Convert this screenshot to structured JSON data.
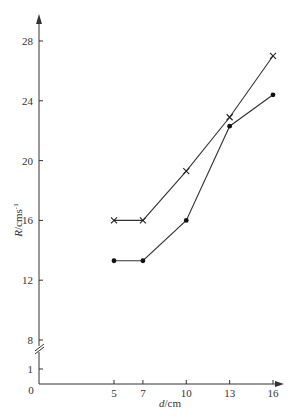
{
  "chart_data": {
    "type": "line",
    "title": "",
    "xlabel": "d/cm",
    "ylabel": "R/cms⁻¹",
    "x_ticks": [
      5,
      7,
      10,
      13,
      16
    ],
    "y_ticks": [
      1,
      8,
      12,
      16,
      20,
      24,
      28
    ],
    "y_origin_label": "0",
    "y_axis_break": "between 1 and 8",
    "grid": false,
    "legend": null,
    "x": [
      5,
      7,
      10,
      13,
      16
    ],
    "series": [
      {
        "name": "cross-marker series",
        "marker": "x",
        "values": [
          16.0,
          16.0,
          19.3,
          22.9,
          27.0
        ]
      },
      {
        "name": "dot-marker series",
        "marker": "dot",
        "values": [
          13.3,
          13.3,
          16.0,
          22.3,
          24.4
        ]
      }
    ],
    "xlim": [
      0,
      16.5
    ],
    "ylim": [
      0,
      30
    ]
  },
  "labels": {
    "xlabel_italic": "d",
    "xlabel_unit": "/cm",
    "ylabel_italic": "R",
    "ylabel_unit": "/cms",
    "ylabel_exp": "-1",
    "origin": "0"
  }
}
